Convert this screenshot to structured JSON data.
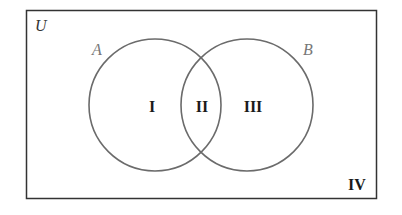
{
  "diagram": {
    "type": "venn",
    "universe_label": "U",
    "sets": [
      {
        "label": "A",
        "label_color": "#777777"
      },
      {
        "label": "B",
        "label_color": "#777777"
      }
    ],
    "regions": [
      {
        "id": "I",
        "label": "I"
      },
      {
        "id": "II",
        "label": "II"
      },
      {
        "id": "III",
        "label": "III"
      },
      {
        "id": "IV",
        "label": "IV"
      }
    ],
    "colors": {
      "border": "#333333",
      "circle_stroke": "#6b6b6b",
      "region_text": "#1a1a1a",
      "universe_text": "#333333"
    }
  }
}
